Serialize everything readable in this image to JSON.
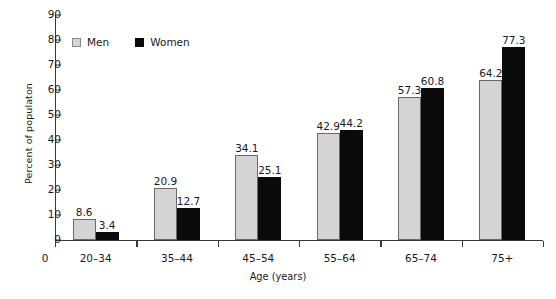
{
  "chart_data": {
    "type": "bar",
    "title": "",
    "subtitle": "",
    "xlabel": "Age (years)",
    "ylabel": "Percent of populaton",
    "categories": [
      "20–34",
      "35–44",
      "45–54",
      "55–64",
      "65–74",
      "75+"
    ],
    "series": [
      {
        "name": "Men",
        "color": "#d4d4d4",
        "values": [
          8.6,
          20.9,
          34.1,
          42.9,
          57.3,
          64.2
        ]
      },
      {
        "name": "Women",
        "color": "#0a0a0a",
        "values": [
          3.4,
          12.7,
          25.1,
          44.2,
          60.8,
          77.3
        ]
      }
    ],
    "value_labels": {
      "men": [
        "8.6",
        "20.9",
        "34.1",
        "42.9",
        "57.3",
        "64.2"
      ],
      "women": [
        "3.4",
        "12.7",
        "25.1",
        "44.2",
        "60.8",
        "77.3"
      ]
    },
    "ylim": [
      0,
      90
    ],
    "yticks": [
      0,
      10,
      20,
      30,
      40,
      50,
      60,
      70,
      80,
      90
    ],
    "ytick_labels": [
      "0",
      "10",
      "20",
      "30",
      "40",
      "50",
      "60",
      "70",
      "80",
      "90"
    ],
    "origin_label": "0",
    "grid": false,
    "legend_position": "top-left",
    "legend": [
      "Men",
      "Women"
    ]
  }
}
